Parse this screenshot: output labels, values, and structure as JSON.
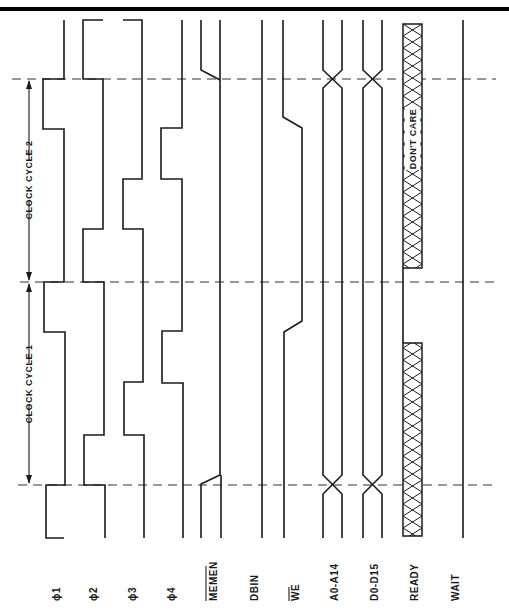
{
  "header": {
    "caption_fragment": ""
  },
  "clock_cycles": [
    {
      "label": "CLOCK CYCLE 2"
    },
    {
      "label": "CLOCK CYCLE 1"
    }
  ],
  "signals": [
    {
      "id": "phi1",
      "label": "ϕ1",
      "overbar": false
    },
    {
      "id": "phi2",
      "label": "ϕ2",
      "overbar": false
    },
    {
      "id": "phi3",
      "label": "ϕ3",
      "overbar": false
    },
    {
      "id": "phi4",
      "label": "ϕ4",
      "overbar": false
    },
    {
      "id": "memen",
      "label": "MEMEN",
      "overbar": true
    },
    {
      "id": "dbin",
      "label": "DBIN",
      "overbar": false
    },
    {
      "id": "we",
      "label": "WE",
      "overbar": true
    },
    {
      "id": "addr",
      "label": "A0-A14",
      "overbar": false
    },
    {
      "id": "data",
      "label": "D0-D15",
      "overbar": false
    },
    {
      "id": "ready",
      "label": "READY",
      "overbar": false
    },
    {
      "id": "wait",
      "label": "WAIT",
      "overbar": false
    }
  ],
  "annotations": {
    "dont_care": "DON'T CARE"
  },
  "colors": {
    "ink": "#1a1a1a",
    "background": "#ffffff",
    "border": "#000000"
  }
}
